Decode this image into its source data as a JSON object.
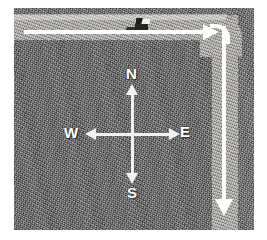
{
  "image": {
    "kind": "aerial-photograph",
    "description": "Grainy grayscale aerial photo of terrain with two lighter roadway bands forming an L, overlaid with white directional route arrows and a compass rose.",
    "plate": {
      "left_margin_px": 14,
      "top_margin_px": 8,
      "width_px": 240,
      "height_px": 222
    },
    "colors": {
      "terrain": "#6b6b6b",
      "terrain_dark": "#5f5f5f",
      "roadway": "#a9a6a0",
      "arrow": "#ffffff",
      "label_text": "#ffffff",
      "object": "#262626",
      "page_background": "#ffffff"
    }
  },
  "route": {
    "horizontal_arrow": {
      "name": "eastbound-route-arrow",
      "direction": "east",
      "heading_degrees": 90
    },
    "vertical_arrow": {
      "name": "southbound-route-arrow",
      "direction": "south",
      "heading_degrees": 180
    },
    "turn": "right turn from eastbound to southbound"
  },
  "path_object": {
    "name": "vehicle-on-roadway",
    "description": "small dark vehicle with trailer on the upper roadway"
  },
  "compass": {
    "name": "compass-rose",
    "labels": {
      "north": "N",
      "south": "S",
      "west": "W",
      "east": "E"
    }
  }
}
